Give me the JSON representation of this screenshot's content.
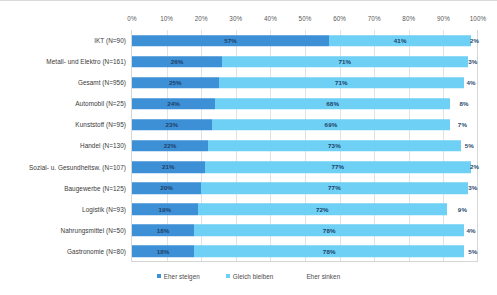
{
  "chart_data": {
    "type": "bar",
    "subtype": "stacked-horizontal-100",
    "title": "",
    "xlabel": "",
    "ylabel": "",
    "xlim": [
      0,
      100
    ],
    "grid": true,
    "legend_position": "bottom",
    "xticks": [
      "0%",
      "10%",
      "20%",
      "30%",
      "40%",
      "50%",
      "60%",
      "70%",
      "80%",
      "90%",
      "100%"
    ],
    "xtick_values": [
      0,
      10,
      20,
      30,
      40,
      50,
      60,
      70,
      80,
      90,
      100
    ],
    "categories": [
      "IKT (N=90)",
      "Metall- und Elektro (N=161)",
      "Gesamt (N=956)",
      "Automobil (N=25)",
      "Kunststoff (N=95)",
      "Handel (N=130)",
      "Sozial- u. Gesundheitsw. (N=107)",
      "Baugewerbe (N=125)",
      "Logistik (N=93)",
      "Nahrungsmittel (N=50)",
      "Gastronomie (N=80)"
    ],
    "series": [
      {
        "name": "Eher steigen",
        "color": "#3d8fd6",
        "values": [
          57,
          26,
          25,
          24,
          23,
          22,
          21,
          20,
          19,
          18,
          18
        ],
        "labels": [
          "57%",
          "26%",
          "25%",
          "24%",
          "23%",
          "22%",
          "21%",
          "20%",
          "19%",
          "18%",
          "18%"
        ]
      },
      {
        "name": "Gleich bleiben",
        "color": "#6ed0f5",
        "values": [
          41,
          71,
          71,
          68,
          69,
          73,
          77,
          77,
          72,
          78,
          78
        ],
        "labels": [
          "41%",
          "71%",
          "71%",
          "68%",
          "69%",
          "73%",
          "77%",
          "77%",
          "72%",
          "78%",
          "78%"
        ]
      },
      {
        "name": "Eher sinken",
        "color": "#ffffff",
        "values": [
          2,
          3,
          4,
          8,
          7,
          5,
          2,
          3,
          9,
          4,
          5
        ],
        "labels": [
          "2%",
          "3%",
          "4%",
          "8%",
          "7%",
          "5%",
          "2%",
          "3%",
          "9%",
          "4%",
          "5%"
        ]
      }
    ]
  },
  "legend": {
    "items": [
      {
        "label": "Eher steigen",
        "swatch": "#3d8fd6",
        "has_swatch": true
      },
      {
        "label": "Gleich bleiben",
        "swatch": "#6ed0f5",
        "has_swatch": true
      },
      {
        "label": "Eher sinken",
        "swatch": "#ffffff",
        "has_swatch": false
      }
    ]
  }
}
